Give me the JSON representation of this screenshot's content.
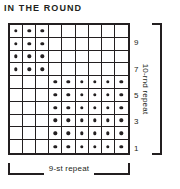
{
  "title": "IN THE ROUND",
  "chart_data": {
    "type": "table",
    "title": "IN THE ROUND",
    "columns": 9,
    "rows": 10,
    "symbols": {
      "dot": "purl stitch",
      "blank": "knit stitch"
    },
    "row_labels_visible": [
      "9",
      "7",
      "5",
      "3",
      "1"
    ],
    "row_label_rows": [
      9,
      7,
      5,
      3,
      1
    ],
    "row_numbering": "bottom-to-top, odd rounds labeled on right",
    "grid": [
      {
        "round": 10,
        "label": "",
        "cells": [
          "dot",
          "dot",
          "dot",
          "blank",
          "blank",
          "blank",
          "blank",
          "blank",
          "blank"
        ]
      },
      {
        "round": 9,
        "label": "9",
        "cells": [
          "dot",
          "dot",
          "dot",
          "blank",
          "blank",
          "blank",
          "blank",
          "blank",
          "blank"
        ]
      },
      {
        "round": 8,
        "label": "",
        "cells": [
          "dot",
          "dot",
          "dot",
          "blank",
          "blank",
          "blank",
          "blank",
          "blank",
          "blank"
        ]
      },
      {
        "round": 7,
        "label": "7",
        "cells": [
          "dot",
          "dot",
          "dot",
          "blank",
          "blank",
          "blank",
          "blank",
          "blank",
          "blank"
        ]
      },
      {
        "round": 6,
        "label": "",
        "cells": [
          "blank",
          "blank",
          "blank",
          "dot",
          "dot",
          "dot",
          "dot",
          "dot",
          "dot"
        ]
      },
      {
        "round": 5,
        "label": "5",
        "cells": [
          "blank",
          "blank",
          "blank",
          "dot",
          "dot",
          "dot",
          "dot",
          "dot",
          "dot"
        ]
      },
      {
        "round": 4,
        "label": "",
        "cells": [
          "blank",
          "blank",
          "blank",
          "dot",
          "dot",
          "dot",
          "dot",
          "dot",
          "dot"
        ]
      },
      {
        "round": 3,
        "label": "3",
        "cells": [
          "blank",
          "blank",
          "blank",
          "dot",
          "dot",
          "dot",
          "dot",
          "dot",
          "dot"
        ]
      },
      {
        "round": 2,
        "label": "",
        "cells": [
          "blank",
          "blank",
          "blank",
          "dot",
          "dot",
          "dot",
          "dot",
          "dot",
          "dot"
        ]
      },
      {
        "round": 1,
        "label": "1",
        "cells": [
          "blank",
          "blank",
          "blank",
          "dot",
          "dot",
          "dot",
          "dot",
          "dot",
          "dot"
        ]
      }
    ],
    "annotations": {
      "vertical_repeat": "10-rnd repeat",
      "horizontal_repeat": "9-st repeat"
    },
    "colors": {
      "ink": "#231f20",
      "background": "#ffffff"
    }
  },
  "brackets": {
    "vertical_label": "10-rnd repeat",
    "horizontal_label": "9-st repeat"
  }
}
